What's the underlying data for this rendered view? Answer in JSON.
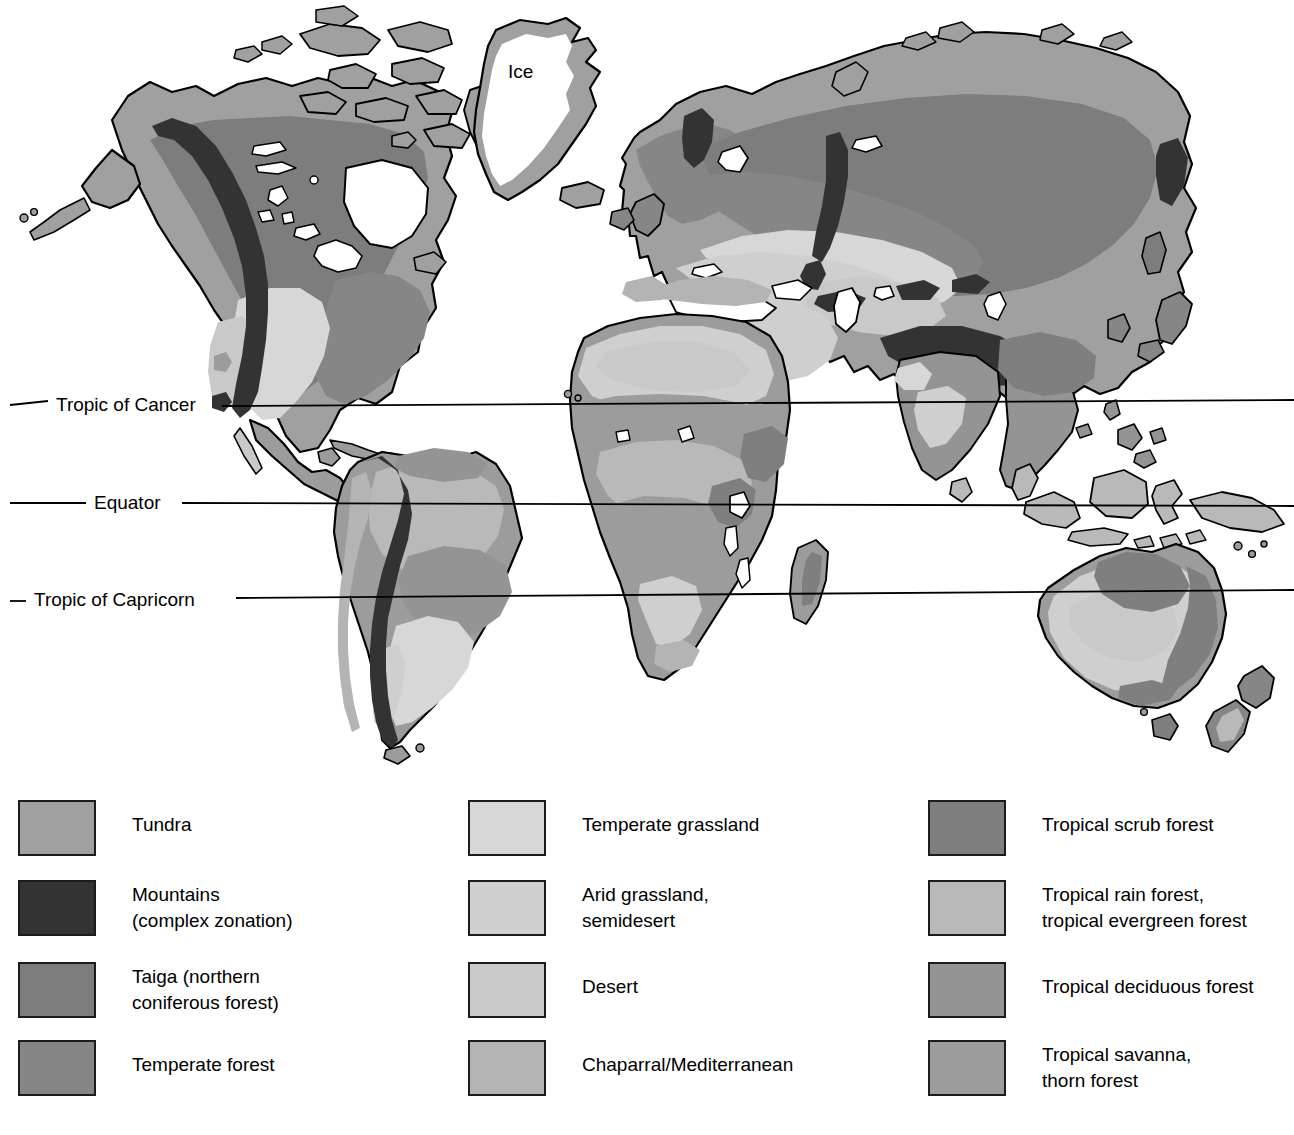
{
  "figure": {
    "map_labels": {
      "ice": "Ice",
      "tropic_of_cancer": "Tropic of Cancer",
      "equator": "Equator",
      "tropic_of_capricorn": "Tropic of Capricorn"
    }
  },
  "legend": {
    "columns": [
      {
        "items": [
          {
            "label": "Tundra",
            "color": "#a0a0a0",
            "lines": 1
          },
          {
            "label": "Mountains\n(complex zonation)",
            "color": "#333333",
            "lines": 2
          },
          {
            "label": "Taiga (northern\nconiferous forest)",
            "color": "#7d7d7d",
            "lines": 2
          },
          {
            "label": "Temperate forest",
            "color": "#868686",
            "lines": 1
          }
        ]
      },
      {
        "items": [
          {
            "label": "Temperate grassland",
            "color": "#d7d7d7",
            "lines": 1
          },
          {
            "label": "Arid grassland,\nsemidesert",
            "color": "#cfcfcf",
            "lines": 2
          },
          {
            "label": "Desert",
            "color": "#c9c9c9",
            "lines": 1
          },
          {
            "label": "Chaparral/Mediterranean",
            "color": "#b4b4b4",
            "lines": 1
          }
        ]
      },
      {
        "items": [
          {
            "label": "Tropical scrub forest",
            "color": "#7f7f7f",
            "lines": 1
          },
          {
            "label": "Tropical rain forest,\ntropical evergreen forest",
            "color": "#b9b9b9",
            "lines": 2
          },
          {
            "label": "Tropical deciduous forest",
            "color": "#949494",
            "lines": 1
          },
          {
            "label": "Tropical savanna,\nthorn forest",
            "color": "#9c9c9c",
            "lines": 2
          }
        ]
      }
    ]
  },
  "map_data": {
    "type": "choropleth-biome-map",
    "projection": "flat world outline",
    "latitude_lines": [
      {
        "name": "Tropic of Cancer",
        "y_px": 405
      },
      {
        "name": "Equator",
        "y_px": 503
      },
      {
        "name": "Tropic of Capricorn",
        "y_px": 600
      }
    ],
    "biome_colors": {
      "ice": "#ffffff",
      "tundra": "#a0a0a0",
      "mountains": "#333333",
      "taiga": "#7d7d7d",
      "temperate_forest": "#868686",
      "temperate_grassland": "#d7d7d7",
      "arid_grassland_semidesert": "#cfcfcf",
      "desert": "#c9c9c9",
      "chaparral_mediterranean": "#b4b4b4",
      "tropical_scrub_forest": "#7f7f7f",
      "tropical_rain_forest": "#b9b9b9",
      "tropical_deciduous_forest": "#949494",
      "tropical_savanna_thorn_forest": "#9c9c9c"
    },
    "outline_color": "#000000",
    "background": "#ffffff"
  }
}
